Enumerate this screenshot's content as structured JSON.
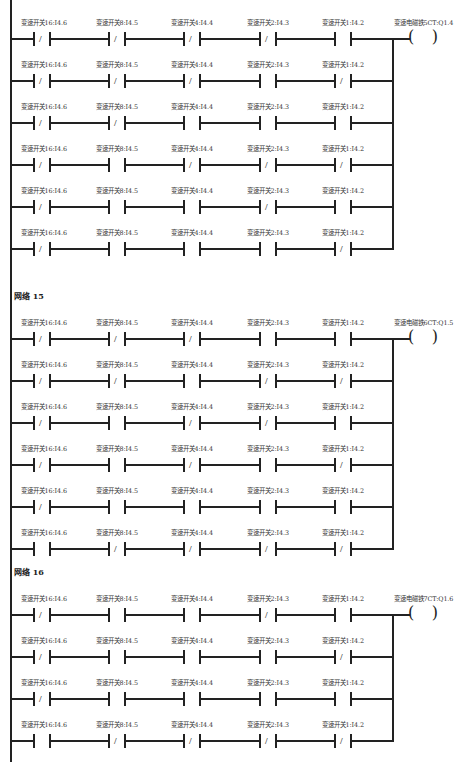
{
  "diagram": {
    "type": "ladder-logic",
    "networks": [
      {
        "title": "",
        "coil": {
          "label": "变速电磁铁5CT:Q1.4"
        },
        "rungs": [
          {
            "contacts": [
              {
                "label": "变速开关16:I4.6",
                "type": "NC"
              },
              {
                "label": "变速开关8:I4.5",
                "type": "NC"
              },
              {
                "label": "变速开关4:I4.4",
                "type": "NC"
              },
              {
                "label": "变速开关2:I4.3",
                "type": "NC"
              },
              {
                "label": "变速开关1:I4.2",
                "type": "NO"
              }
            ]
          },
          {
            "contacts": [
              {
                "label": "变速开关16:I4.6",
                "type": "NC"
              },
              {
                "label": "变速开关8:I4.5",
                "type": "NC"
              },
              {
                "label": "变速开关4:I4.4",
                "type": "NC"
              },
              {
                "label": "变速开关2:I4.3",
                "type": "NO"
              },
              {
                "label": "变速开关1:I4.2",
                "type": "NC"
              }
            ]
          },
          {
            "contacts": [
              {
                "label": "变速开关16:I4.6",
                "type": "NC"
              },
              {
                "label": "变速开关8:I4.5",
                "type": "NC"
              },
              {
                "label": "变速开关4:I4.4",
                "type": "NO"
              },
              {
                "label": "变速开关2:I4.3",
                "type": "NO"
              },
              {
                "label": "变速开关1:I4.2",
                "type": "NO"
              }
            ]
          },
          {
            "contacts": [
              {
                "label": "变速开关16:I4.6",
                "type": "NC"
              },
              {
                "label": "变速开关8:I4.5",
                "type": "NO"
              },
              {
                "label": "变速开关4:I4.4",
                "type": "NC"
              },
              {
                "label": "变速开关2:I4.3",
                "type": "NC"
              },
              {
                "label": "变速开关1:I4.2",
                "type": "NC"
              }
            ]
          },
          {
            "contacts": [
              {
                "label": "变速开关16:I4.6",
                "type": "NC"
              },
              {
                "label": "变速开关8:I4.5",
                "type": "NO"
              },
              {
                "label": "变速开关4:I4.4",
                "type": "NO"
              },
              {
                "label": "变速开关2:I4.3",
                "type": "NC"
              },
              {
                "label": "变速开关1:I4.2",
                "type": "NO"
              }
            ]
          },
          {
            "contacts": [
              {
                "label": "变速开关16:I4.6",
                "type": "NC"
              },
              {
                "label": "变速开关8:I4.5",
                "type": "NO"
              },
              {
                "label": "变速开关4:I4.4",
                "type": "NO"
              },
              {
                "label": "变速开关2:I4.3",
                "type": "NO"
              },
              {
                "label": "变速开关1:I4.2",
                "type": "NC"
              }
            ]
          }
        ]
      },
      {
        "title": "网络 15",
        "coil": {
          "label": "变速电磁铁6CT:Q1.5"
        },
        "rungs": [
          {
            "contacts": [
              {
                "label": "变速开关16:I4.6",
                "type": "NC"
              },
              {
                "label": "变速开关8:I4.5",
                "type": "NC"
              },
              {
                "label": "变速开关4:I4.4",
                "type": "NC"
              },
              {
                "label": "变速开关2:I4.3",
                "type": "NO"
              },
              {
                "label": "变速开关1:I4.2",
                "type": "NO"
              }
            ]
          },
          {
            "contacts": [
              {
                "label": "变速开关16:I4.6",
                "type": "NC"
              },
              {
                "label": "变速开关8:I4.5",
                "type": "NC"
              },
              {
                "label": "变速开关4:I4.4",
                "type": "NO"
              },
              {
                "label": "变速开关2:I4.3",
                "type": "NC"
              },
              {
                "label": "变速开关1:I4.2",
                "type": "NC"
              }
            ]
          },
          {
            "contacts": [
              {
                "label": "变速开关16:I4.6",
                "type": "NC"
              },
              {
                "label": "变速开关8:I4.5",
                "type": "NO"
              },
              {
                "label": "变速开关4:I4.4",
                "type": "NC"
              },
              {
                "label": "变速开关2:I4.3",
                "type": "NC"
              },
              {
                "label": "变速开关1:I4.2",
                "type": "NO"
              }
            ]
          },
          {
            "contacts": [
              {
                "label": "变速开关16:I4.6",
                "type": "NC"
              },
              {
                "label": "变速开关8:I4.5",
                "type": "NO"
              },
              {
                "label": "变速开关4:I4.4",
                "type": "NC"
              },
              {
                "label": "变速开关2:I4.3",
                "type": "NO"
              },
              {
                "label": "变速开关1:I4.2",
                "type": "NC"
              }
            ]
          },
          {
            "contacts": [
              {
                "label": "变速开关16:I4.6",
                "type": "NC"
              },
              {
                "label": "变速开关8:I4.5",
                "type": "NO"
              },
              {
                "label": "变速开关4:I4.4",
                "type": "NO"
              },
              {
                "label": "变速开关2:I4.3",
                "type": "NO"
              },
              {
                "label": "变速开关1:I4.2",
                "type": "NO"
              }
            ]
          },
          {
            "contacts": [
              {
                "label": "变速开关16:I4.6",
                "type": "NO"
              },
              {
                "label": "变速开关8:I4.5",
                "type": "NC"
              },
              {
                "label": "变速开关4:I4.4",
                "type": "NC"
              },
              {
                "label": "变速开关2:I4.3",
                "type": "NC"
              },
              {
                "label": "变速开关1:I4.2",
                "type": "NC"
              }
            ]
          }
        ]
      },
      {
        "title": "网络 16",
        "coil": {
          "label": "变速电磁铁7CT:Q1.6"
        },
        "rungs": [
          {
            "contacts": [
              {
                "label": "变速开关16:I4.6",
                "type": "NC"
              },
              {
                "label": "变速开关8:I4.5",
                "type": "NO"
              },
              {
                "label": "变速开关4:I4.4",
                "type": "NO"
              },
              {
                "label": "变速开关2:I4.3",
                "type": "NC"
              },
              {
                "label": "变速开关1:I4.2",
                "type": "NO"
              }
            ]
          },
          {
            "contacts": [
              {
                "label": "变速开关16:I4.6",
                "type": "NC"
              },
              {
                "label": "变速开关8:I4.5",
                "type": "NO"
              },
              {
                "label": "变速开关4:I4.4",
                "type": "NO"
              },
              {
                "label": "变速开关2:I4.3",
                "type": "NO"
              },
              {
                "label": "变速开关1:I4.2",
                "type": "NC"
              }
            ]
          },
          {
            "contacts": [
              {
                "label": "变速开关16:I4.6",
                "type": "NC"
              },
              {
                "label": "变速开关8:I4.5",
                "type": "NO"
              },
              {
                "label": "变速开关4:I4.4",
                "type": "NO"
              },
              {
                "label": "变速开关2:I4.3",
                "type": "NO"
              },
              {
                "label": "变速开关1:I4.2",
                "type": "NO"
              }
            ]
          },
          {
            "contacts": [
              {
                "label": "变速开关16:I4.6",
                "type": "NO"
              },
              {
                "label": "变速开关8:I4.5",
                "type": "NC"
              },
              {
                "label": "变速开关4:I4.4",
                "type": "NC"
              },
              {
                "label": "变速开关2:I4.3",
                "type": "NC"
              },
              {
                "label": "变速开关1:I4.2",
                "type": "NC"
              }
            ]
          }
        ]
      }
    ],
    "layout": {
      "network_tops": [
        8,
        296,
        572
      ],
      "rung_spacing": 42,
      "first_rung_offset": [
        0,
        12,
        12
      ],
      "contact_x": [
        33,
        108,
        183,
        259,
        334
      ],
      "bus_x": 392,
      "coil_x": 408,
      "rail_extent": [
        [
          0,
          252
        ],
        [
          252,
          552
        ],
        [
          552,
          762
        ]
      ]
    },
    "colors": {
      "line": "#222222",
      "text": "#333333",
      "background": "#ffffff"
    }
  }
}
